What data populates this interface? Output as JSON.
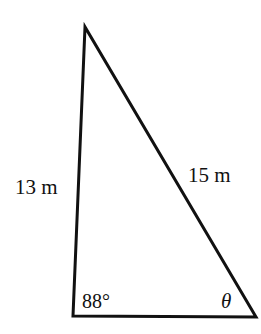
{
  "figure": {
    "type": "triangle",
    "stroke_color": "#111111",
    "vertices": {
      "top": [
        85,
        27
      ],
      "bottom_left": [
        73,
        316
      ],
      "bottom_right": [
        256,
        317
      ]
    }
  },
  "labels": {
    "left_side": "13 m",
    "hypotenuse": "15 m",
    "bottom_left_angle": "88°",
    "bottom_right_angle": "θ"
  }
}
